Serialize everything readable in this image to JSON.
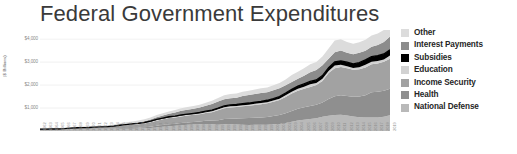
{
  "chart_data": {
    "type": "area",
    "title": "Federal Government Expenditures",
    "xlabel": "",
    "ylabel": "($ Billions)",
    "ylim": [
      0,
      4400
    ],
    "yticks": [
      1000,
      2000,
      3000,
      4000
    ],
    "ytick_labels": [
      "$1,000",
      "$2,000",
      "$3,000",
      "$4,000"
    ],
    "grid": true,
    "legend_position": "right",
    "stacked": true,
    "overlay_line": {
      "name": "Subsidies",
      "color": "#000000",
      "note": "black line drawn on top of the stacked bands"
    },
    "categories": [
      "1962",
      "1963",
      "1964",
      "1965",
      "1966",
      "1967",
      "1968",
      "1969",
      "1970",
      "1971",
      "1972",
      "1973",
      "1974",
      "1975",
      "1976",
      "1977",
      "1978",
      "1979",
      "1980",
      "1981",
      "1982",
      "1983",
      "1984",
      "1985",
      "1986",
      "1987",
      "1988",
      "1989",
      "1990",
      "1991",
      "1992",
      "1993",
      "1994",
      "1995",
      "1996",
      "1997",
      "1998",
      "1999",
      "2000",
      "2001",
      "2002",
      "2003",
      "2004",
      "2005",
      "2006",
      "2007",
      "2008",
      "2009",
      "2010",
      "2011",
      "2012",
      "2013",
      "2014",
      "2015",
      "2016",
      "2017",
      "2018",
      "2019"
    ],
    "series": [
      {
        "name": "National Defense",
        "color": "#b9b9b9",
        "values": [
          52,
          53,
          54,
          51,
          59,
          72,
          82,
          82,
          82,
          79,
          79,
          77,
          80,
          87,
          90,
          97,
          104,
          116,
          134,
          158,
          186,
          210,
          227,
          253,
          273,
          282,
          290,
          304,
          299,
          273,
          298,
          291,
          282,
          272,
          266,
          271,
          268,
          275,
          295,
          306,
          349,
          405,
          455,
          495,
          522,
          551,
          616,
          661,
          694,
          706,
          678,
          634,
          603,
          589,
          593,
          590,
          623,
          686
        ]
      },
      {
        "name": "Health",
        "color": "#8f8f8f",
        "values": [
          2,
          2,
          2,
          3,
          4,
          7,
          10,
          12,
          13,
          15,
          18,
          19,
          22,
          28,
          33,
          38,
          43,
          49,
          55,
          66,
          74,
          81,
          87,
          95,
          102,
          112,
          123,
          142,
          156,
          194,
          222,
          247,
          266,
          285,
          297,
          310,
          324,
          340,
          362,
          390,
          426,
          471,
          509,
          537,
          562,
          588,
          628,
          734,
          821,
          854,
          847,
          858,
          899,
          972,
          1097,
          1117,
          1131,
          1160
        ]
      },
      {
        "name": "Income Security",
        "color": "#a2a2a2",
        "values": [
          23,
          25,
          26,
          26,
          28,
          32,
          36,
          40,
          44,
          56,
          64,
          73,
          85,
          109,
          127,
          137,
          146,
          158,
          187,
          225,
          248,
          276,
          277,
          289,
          298,
          309,
          321,
          337,
          367,
          433,
          470,
          489,
          499,
          516,
          534,
          552,
          570,
          590,
          617,
          655,
          710,
          757,
          787,
          804,
          830,
          860,
          935,
          1137,
          1215,
          1228,
          1205,
          1177,
          1186,
          1206,
          1222,
          1236,
          1263,
          1300
        ]
      },
      {
        "name": "Education",
        "color": "#d2d2d2",
        "values": [
          1,
          1,
          1,
          2,
          4,
          6,
          7,
          7,
          8,
          9,
          10,
          12,
          12,
          16,
          19,
          21,
          26,
          30,
          32,
          33,
          27,
          26,
          27,
          29,
          30,
          30,
          32,
          36,
          39,
          43,
          45,
          50,
          46,
          54,
          52,
          53,
          55,
          51,
          54,
          58,
          71,
          82,
          88,
          97,
          118,
          92,
          92,
          80,
          128,
          102,
          91,
          73,
          91,
          122,
          107,
          111,
          96,
          138
        ]
      },
      {
        "name": "Subsidies",
        "color": "#000000",
        "values": [
          4,
          5,
          5,
          5,
          5,
          5,
          6,
          6,
          6,
          7,
          8,
          9,
          10,
          11,
          13,
          14,
          15,
          17,
          19,
          22,
          25,
          28,
          30,
          33,
          36,
          38,
          41,
          44,
          48,
          52,
          56,
          59,
          62,
          66,
          70,
          74,
          78,
          83,
          88,
          93,
          99,
          106,
          112,
          119,
          126,
          133,
          141,
          149,
          158,
          167,
          176,
          186,
          196,
          207,
          218,
          230,
          242,
          255
        ]
      },
      {
        "name": "Interest Payments",
        "color": "#8c8c8c",
        "values": [
          9,
          10,
          11,
          11,
          12,
          13,
          14,
          16,
          19,
          20,
          21,
          24,
          29,
          32,
          37,
          41,
          48,
          59,
          75,
          96,
          117,
          129,
          154,
          179,
          191,
          196,
          214,
          241,
          264,
          286,
          292,
          293,
          296,
          332,
          344,
          356,
          363,
          353,
          362,
          360,
          333,
          318,
          322,
          352,
          406,
          430,
          451,
          383,
          414,
          454,
          415,
          416,
          430,
          402,
          432,
          458,
          523,
          575
        ]
      },
      {
        "name": "Other",
        "color": "#dcdcdc",
        "values": [
          16,
          17,
          18,
          21,
          24,
          27,
          30,
          30,
          32,
          34,
          37,
          41,
          45,
          53,
          60,
          66,
          72,
          78,
          86,
          92,
          97,
          102,
          108,
          115,
          118,
          121,
          124,
          131,
          142,
          161,
          172,
          178,
          182,
          188,
          192,
          196,
          199,
          204,
          213,
          226,
          258,
          296,
          312,
          326,
          341,
          352,
          383,
          452,
          512,
          491,
          468,
          452,
          458,
          472,
          488,
          502,
          518,
          540
        ]
      }
    ]
  },
  "legend": {
    "items": [
      {
        "label": "Other",
        "color": "#dcdcdc"
      },
      {
        "label": "Interest Payments",
        "color": "#8c8c8c"
      },
      {
        "label": "Subsidies",
        "color": "#000000"
      },
      {
        "label": "Education",
        "color": "#d2d2d2"
      },
      {
        "label": "Income Security",
        "color": "#a2a2a2"
      },
      {
        "label": "Health",
        "color": "#8f8f8f"
      },
      {
        "label": "National Defense",
        "color": "#b9b9b9"
      }
    ]
  },
  "axes": {
    "y_title": "($ Billions)",
    "y_tick_labels": [
      "$4,000",
      "$3,000",
      "$2,000",
      "$1,000"
    ]
  },
  "colors": {
    "background": "#ffffff",
    "title": "#3a3a3a",
    "gridline": "#e8e8e8",
    "tick_text": "#8a8a8a"
  }
}
